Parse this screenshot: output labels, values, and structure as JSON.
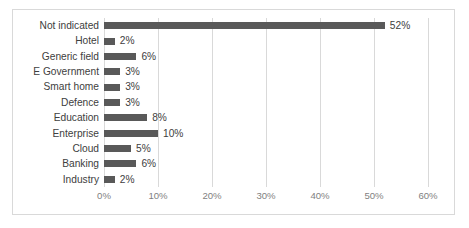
{
  "chart_data": {
    "type": "bar",
    "orientation": "horizontal",
    "title": "",
    "xlabel": "",
    "ylabel": "",
    "xlim": [
      0,
      60
    ],
    "xtick_labels": [
      "0%",
      "10%",
      "20%",
      "30%",
      "40%",
      "50%",
      "60%"
    ],
    "xticks": [
      0,
      10,
      20,
      30,
      40,
      50,
      60
    ],
    "grid": "vertical",
    "legend": "none",
    "bar_color": "#595959",
    "gridline_color": "#d9d9d9",
    "label_color": "#404040",
    "tick_color": "#7f7f7f",
    "frame_color": "#d9d9d9",
    "categories": [
      "Not indicated",
      "Hotel",
      "Generic field",
      "E Government",
      "Smart home",
      "Defence",
      "Education",
      "Enterprise",
      "Cloud",
      "Banking",
      "Industry"
    ],
    "values": [
      52,
      2,
      6,
      3,
      3,
      3,
      8,
      10,
      5,
      6,
      2
    ],
    "data_labels": [
      "52%",
      "2%",
      "6%",
      "3%",
      "3%",
      "3%",
      "8%",
      "10%",
      "5%",
      "6%",
      "2%"
    ]
  }
}
